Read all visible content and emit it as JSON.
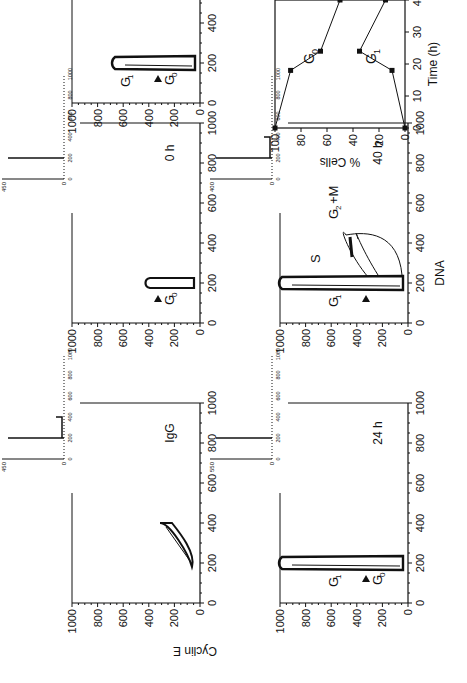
{
  "figure": {
    "xlabel": "DNA",
    "ylabel": "Cyclin E",
    "panels": [
      {
        "id": "igg",
        "label": "IgG",
        "inset_ymax": "450",
        "annotations": []
      },
      {
        "id": "0h",
        "label": "0 h",
        "inset_ymax": "450",
        "annotations": [
          "G0"
        ]
      },
      {
        "id": "18h",
        "label": "18 h",
        "inset_ymax": "500",
        "annotations": [
          "G1",
          "G0"
        ]
      },
      {
        "id": "24h",
        "label": "24 h",
        "inset_ymax": "550",
        "annotations": [
          "G1",
          "G0"
        ]
      },
      {
        "id": "40h",
        "label": "40 h",
        "inset_ymax": "400",
        "annotations": [
          "G1",
          "S",
          "G2+M"
        ]
      }
    ],
    "axis_ticks": [
      "0",
      "200",
      "400",
      "600",
      "800",
      "1000"
    ],
    "inset_ticks": [
      "0",
      "200",
      "400",
      "600",
      "800",
      "1000"
    ],
    "inset_ymin": "0"
  },
  "chart_data": {
    "type": "line",
    "title": "",
    "xlabel": "Time (h)",
    "ylabel": "% Cells",
    "xlim": [
      0,
      40
    ],
    "ylim": [
      0,
      100
    ],
    "xticks": [
      0,
      10,
      20,
      30,
      40
    ],
    "yticks": [
      0,
      20,
      40,
      60,
      80,
      100
    ],
    "x": [
      0,
      18,
      24,
      40
    ],
    "series": [
      {
        "name": "G0",
        "values": [
          100,
          88,
          65,
          50
        ]
      },
      {
        "name": "G1",
        "values": [
          0,
          10,
          35,
          15
        ]
      }
    ],
    "grid": false
  }
}
